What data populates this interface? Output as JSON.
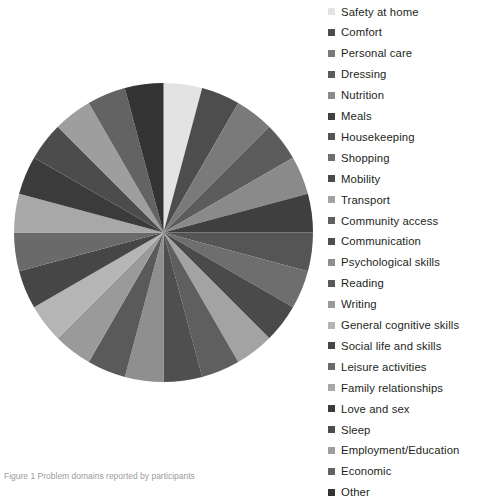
{
  "figure": {
    "background": "#ffffff",
    "caption": "Figure 1 Problem domains reported by participants"
  },
  "legend": {
    "position": "right",
    "swatch_shape": "square",
    "items": [
      {
        "label": "Safety at home",
        "color": "#e3e3e3"
      },
      {
        "label": "Comfort",
        "color": "#4d4d4d"
      },
      {
        "label": "Personal care",
        "color": "#7a7a7a"
      },
      {
        "label": "Dressing",
        "color": "#5c5c5c"
      },
      {
        "label": "Nutrition",
        "color": "#8a8a8a"
      },
      {
        "label": "Meals",
        "color": "#3f3f3f"
      },
      {
        "label": "Housekeeping",
        "color": "#555555"
      },
      {
        "label": "Shopping",
        "color": "#6e6e6e"
      },
      {
        "label": "Mobility",
        "color": "#4a4a4a"
      },
      {
        "label": "Transport",
        "color": "#a3a3a3"
      },
      {
        "label": "Community access",
        "color": "#5f5f5f"
      },
      {
        "label": "Communication",
        "color": "#4f4f4f"
      },
      {
        "label": "Psychological skills",
        "color": "#8f8f8f"
      },
      {
        "label": "Reading",
        "color": "#5a5a5a"
      },
      {
        "label": "Writing",
        "color": "#9a9a9a"
      },
      {
        "label": "General cognitive skills",
        "color": "#b5b5b5"
      },
      {
        "label": "Social life and skills",
        "color": "#464646"
      },
      {
        "label": "Leisure activities",
        "color": "#6a6a6a"
      },
      {
        "label": "Family relationships",
        "color": "#a8a8a8"
      },
      {
        "label": "Love and sex",
        "color": "#3b3b3b"
      },
      {
        "label": "Sleep",
        "color": "#4c4c4c"
      },
      {
        "label": "Employment/Education",
        "color": "#9e9e9e"
      },
      {
        "label": "Economic",
        "color": "#636363"
      },
      {
        "label": "Other",
        "color": "#333333"
      }
    ]
  },
  "chart_data": {
    "type": "pie",
    "title": "",
    "start_angle": 0,
    "direction": "clockwise",
    "categories": [
      "Safety at home",
      "Comfort",
      "Personal care",
      "Dressing",
      "Nutrition",
      "Meals",
      "Housekeeping",
      "Shopping",
      "Mobility",
      "Transport",
      "Community access",
      "Communication",
      "Psychological skills",
      "Reading",
      "Writing",
      "General cognitive skills",
      "Social life and skills",
      "Leisure activities",
      "Family relationships",
      "Love and sex",
      "Sleep",
      "Employment/Education",
      "Economic",
      "Other"
    ],
    "values": [
      1,
      1,
      1,
      1,
      1,
      1,
      1,
      1,
      1,
      1,
      1,
      1,
      1,
      1,
      1,
      1,
      1,
      1,
      1,
      1,
      1,
      1,
      1,
      1
    ],
    "colors": [
      "#e3e3e3",
      "#4d4d4d",
      "#7a7a7a",
      "#5c5c5c",
      "#8a8a8a",
      "#3f3f3f",
      "#555555",
      "#6e6e6e",
      "#4a4a4a",
      "#a3a3a3",
      "#5f5f5f",
      "#4f4f4f",
      "#8f8f8f",
      "#5a5a5a",
      "#9a9a9a",
      "#b5b5b5",
      "#464646",
      "#6a6a6a",
      "#a8a8a8",
      "#3b3b3b",
      "#4c4c4c",
      "#9e9e9e",
      "#636363",
      "#333333"
    ],
    "slice_count": 24,
    "data_labels": false,
    "legend": true
  }
}
